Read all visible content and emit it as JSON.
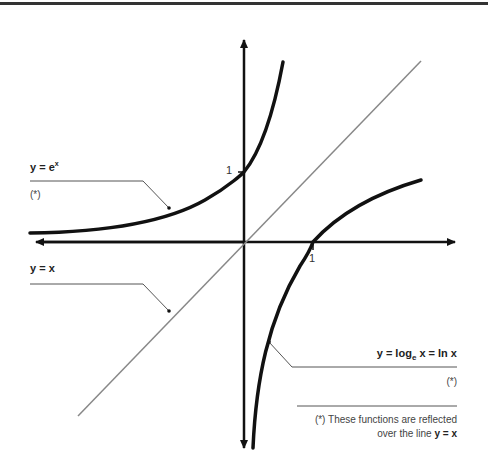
{
  "diagram": {
    "title": "",
    "axes": {
      "x_tick_label": "1",
      "y_tick_label": "1"
    },
    "curves": [
      {
        "name": "exponential",
        "label_prefix": "y = e",
        "label_sup": "x",
        "note": "(*)"
      },
      {
        "name": "identity",
        "label": "y = x"
      },
      {
        "name": "logarithm",
        "label_pre": "y = log",
        "label_sub": "e",
        "label_post": " x = ln x",
        "note": "(*)"
      }
    ],
    "footnote": {
      "line1": "(*) These functions are reflected",
      "line2_prefix": "over the line ",
      "line2_bold": "y = x"
    },
    "colors": {
      "axis": "#111111",
      "curve": "#111111",
      "identity_line": "#888888",
      "leader": "#555555"
    }
  }
}
